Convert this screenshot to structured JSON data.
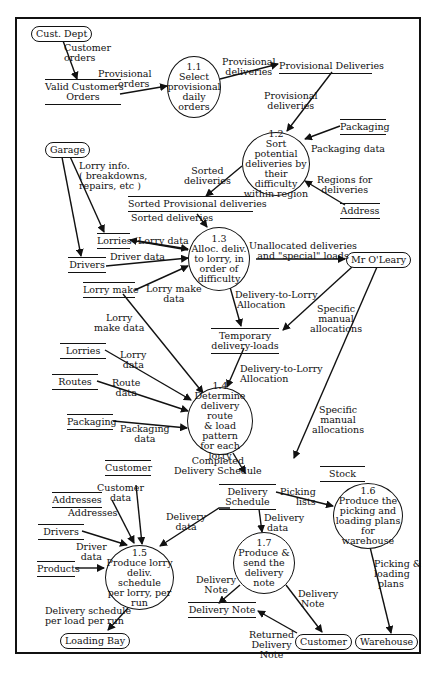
{
  "diagram": {
    "type": "data-flow-diagram",
    "processes": [
      {
        "id": "1.1",
        "lines": [
          "1.1",
          "Select",
          "provisional",
          "daily orders"
        ]
      },
      {
        "id": "1.2",
        "lines": [
          "1.2",
          "Sort potential",
          "deliveries by",
          "their difficulty",
          "within region"
        ]
      },
      {
        "id": "1.3",
        "lines": [
          "1.3",
          "Alloc. deliv.",
          "to lorry, in",
          "order of",
          "difficulty"
        ]
      },
      {
        "id": "1.4",
        "lines": [
          "1.4",
          "Determine",
          "delivery route",
          "& load pattern",
          "for each lorry"
        ]
      },
      {
        "id": "1.5",
        "lines": [
          "1.5",
          "Produce lorry",
          "deliv. schedule",
          "per lorry, per",
          "run"
        ]
      },
      {
        "id": "1.6",
        "lines": [
          "1.6",
          "Produce the",
          "picking and",
          "loading plans",
          "for warehouse"
        ]
      },
      {
        "id": "1.7",
        "lines": [
          "1.7",
          "Produce &",
          "send the",
          "delivery",
          "note"
        ]
      }
    ],
    "externals": {
      "cust_dept": "Cust. Dept",
      "garage": "Garage",
      "mr_oleary": "Mr O'Leary",
      "loading_bay": "Loading Bay",
      "customer": "Customer",
      "warehouse": "Warehouse"
    },
    "stores": {
      "valid_customers_orders": [
        "Valid Customers",
        "Orders"
      ],
      "provisional_deliveries": "Provisional  Deliveries",
      "packaging_1": "Packaging",
      "address": "Address",
      "sorted_provisional_deliveries": "Sorted Provisional deliveries",
      "lorries_1": "Lorries",
      "drivers_1": "Drivers",
      "lorry_make": "Lorry make",
      "temporary_delivery_loads": [
        "Temporary",
        "delivery-loads"
      ],
      "lorries_2": "Lorries",
      "routes": "Routes",
      "packaging_2": "Packaging",
      "customer_store": "Customer",
      "addresses": "Addresses",
      "drivers_2": "Drivers",
      "products": "Products",
      "delivery_schedule": [
        "Delivery",
        "Schedule"
      ],
      "stock": "Stock",
      "delivery_note": "Delivery  Note"
    },
    "flows": {
      "customer_orders": [
        "Customer",
        "orders"
      ],
      "provisional_orders": [
        "Provisional",
        "orders"
      ],
      "provisional_deliveries_out": [
        "Provisional",
        "deliveries"
      ],
      "provisional_deliveries_in": [
        "Provisional",
        "deliveries"
      ],
      "packaging_data": "Packaging data",
      "regions_for_deliveries": [
        "Regions for",
        "deliveries"
      ],
      "sorted_deliveries_out": [
        "Sorted",
        "deliveries"
      ],
      "sorted_deliveries_in": "Sorted deliveries",
      "lorry_info": [
        "Lorry info.",
        "( breakdowns,",
        "repairs, etc )"
      ],
      "lorry_data_1": "Lorry data",
      "driver_data_1": "Driver data",
      "lorry_make_data_1": [
        "Lorry make",
        "data"
      ],
      "unallocated": [
        "Unallocated deliveries",
        "and \"special\" loads"
      ],
      "delivery_to_lorry_1": [
        "Delivery-to-Lorry",
        "Allocation"
      ],
      "specific_manual_1": [
        "Specific",
        "manual",
        "allocations"
      ],
      "lorry_make_data_2": [
        "Lorry",
        "make data"
      ],
      "lorry_data_2": [
        "Lorry",
        "data"
      ],
      "route_data": [
        "Route",
        "data"
      ],
      "packaging_data_2": [
        "Packaging",
        "data"
      ],
      "delivery_to_lorry_2": [
        "Delivery-to-Lorry",
        "Allocation"
      ],
      "specific_manual_2": [
        "Specific",
        "manual",
        "allocations"
      ],
      "completed_schedule": [
        "Completed",
        "Delivery Schedule"
      ],
      "customer_data": [
        "Customer",
        "data"
      ],
      "addresses_flow": "Addresses",
      "driver_data_2": [
        "Driver",
        "data"
      ],
      "delivery_data_1": [
        "Delivery",
        "data"
      ],
      "delivery_data_2": [
        "Delivery",
        "data"
      ],
      "picking_lists": [
        "Picking",
        "lists"
      ],
      "picking_loading_plans": [
        "Picking &",
        "loading",
        "plans"
      ],
      "delivery_note_1": [
        "Delivery",
        "Note"
      ],
      "delivery_note_2": [
        "Delivery",
        "Note"
      ],
      "returned_delivery_note": [
        "Returned",
        "Delivery",
        "Note"
      ],
      "delivery_schedule_per_load": [
        "Delivery schedule",
        "per load per run"
      ]
    }
  }
}
